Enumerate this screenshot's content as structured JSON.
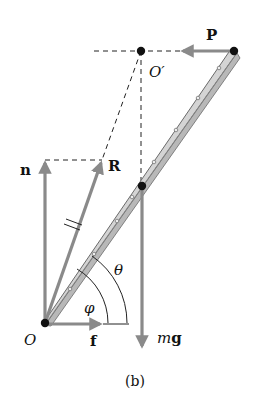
{
  "figure": {
    "caption": "(b)",
    "colors": {
      "force_arrow": "#8a8a8a",
      "dashed_line": "#222222",
      "point": "#111111",
      "ladder_fill": "#d4d4d4",
      "ladder_edge": "#6a6a6a",
      "text": "#111111"
    }
  },
  "labels": {
    "P": "P",
    "O_prime": "O′",
    "n": "n",
    "R": "R",
    "O": "O",
    "f": "f",
    "m": "m",
    "g": "g",
    "theta": "θ",
    "phi": "φ"
  },
  "points": {
    "O": {
      "x": 45,
      "y": 323
    },
    "O_prime": {
      "x": 141,
      "y": 51
    },
    "P_end": {
      "x": 234,
      "y": 51
    },
    "center_of_mass": {
      "x": 142,
      "y": 186
    }
  },
  "vectors": [
    {
      "name": "P",
      "from": [
        234,
        51
      ],
      "to": [
        180,
        51
      ]
    },
    {
      "name": "n",
      "from": [
        45,
        323
      ],
      "to": [
        45,
        160
      ]
    },
    {
      "name": "R",
      "from": [
        45,
        323
      ],
      "to": [
        102,
        160
      ]
    },
    {
      "name": "f",
      "from": [
        45,
        324
      ],
      "to": [
        103,
        324
      ]
    },
    {
      "name": "mg",
      "from": [
        142,
        186
      ],
      "to": [
        142,
        349
      ]
    }
  ]
}
